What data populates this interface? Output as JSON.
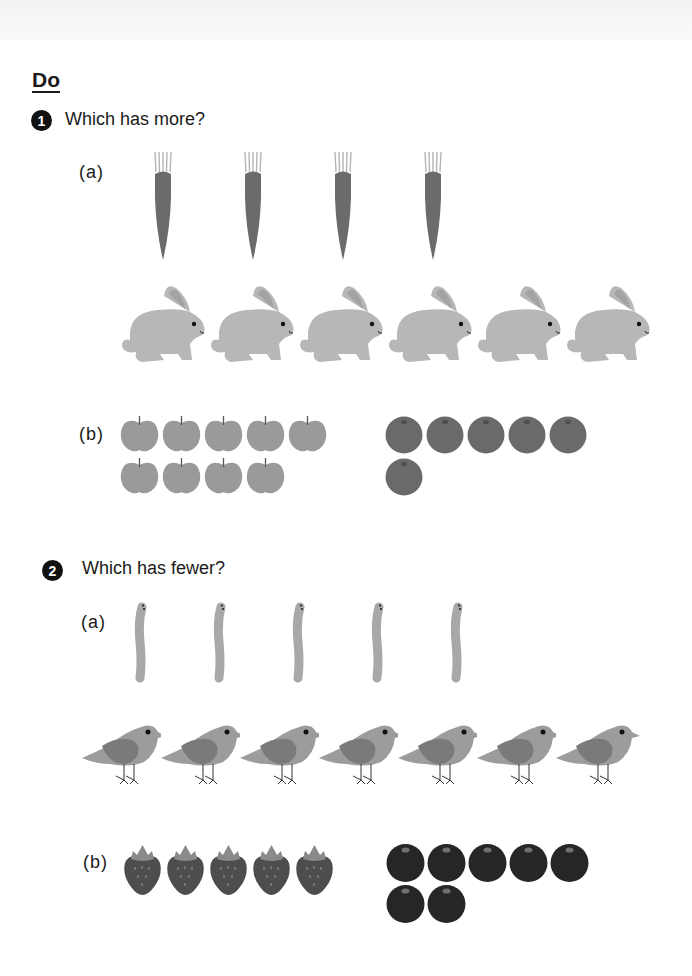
{
  "page": {
    "section_title": "Do"
  },
  "questions": [
    {
      "number": "1",
      "prompt": "Which has more?",
      "parts": [
        {
          "label": "(a)",
          "groups": [
            {
              "item": "carrot",
              "count": 4,
              "color": "#6b6b6b",
              "leaf_color": "#b5b5b5"
            },
            {
              "item": "rabbit",
              "count": 6,
              "color": "#b7b7b7"
            }
          ]
        },
        {
          "label": "(b)",
          "groups": [
            {
              "item": "apple",
              "count": 9,
              "color": "#9a9a9a"
            },
            {
              "item": "orange",
              "count": 6,
              "color": "#6a6a6a"
            }
          ]
        }
      ]
    },
    {
      "number": "2",
      "prompt": "Which has fewer?",
      "parts": [
        {
          "label": "(a)",
          "groups": [
            {
              "item": "worm",
              "count": 5,
              "color": "#a8a8a8"
            },
            {
              "item": "bird",
              "count": 7,
              "color": "#9c9c9c",
              "wing_color": "#7a7a7a"
            }
          ]
        },
        {
          "label": "(b)",
          "groups": [
            {
              "item": "strawberry",
              "count": 5,
              "color": "#4d4d4d",
              "leaf_color": "#8a8a8a"
            },
            {
              "item": "blueberry",
              "count": 7,
              "color": "#262626"
            }
          ]
        }
      ]
    }
  ]
}
